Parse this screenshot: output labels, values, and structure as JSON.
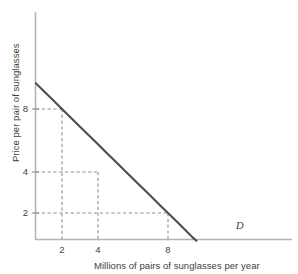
{
  "chart_data": {
    "type": "line",
    "title": "",
    "subtitle": "",
    "xlabel": "Millions of pairs of sunglasses per year",
    "ylabel": "Price per pair of sunglasses",
    "grid": false,
    "legend_position": "inline-right-end",
    "x_scale": "log",
    "y_scale": "log",
    "xlim": [
      1.35,
      12.0
    ],
    "ylim": [
      1.45,
      14.0
    ],
    "xticks": [
      2,
      4,
      8
    ],
    "xtick_labels": [
      "2",
      "4",
      "8"
    ],
    "yticks": [
      2,
      4,
      8
    ],
    "ytick_labels": [
      "2",
      "4",
      "8"
    ],
    "series": [
      {
        "name": "D",
        "label": "D",
        "description": "Demand curve, constant expenditure hyperbola p = 16 / q",
        "relation": "price = 16 / quantity",
        "x": [
          1.42,
          1.6,
          1.8,
          2.0,
          2.4,
          2.8,
          3.2,
          3.6,
          4.0,
          4.8,
          5.6,
          6.4,
          7.2,
          8.0,
          9.0,
          10.0,
          11.0,
          11.6
        ],
        "y": [
          11.27,
          10.0,
          8.89,
          8.0,
          6.67,
          5.71,
          5.0,
          4.44,
          4.0,
          3.33,
          2.86,
          2.5,
          2.22,
          2.0,
          1.78,
          1.6,
          1.45,
          1.38
        ]
      }
    ],
    "annotations": [
      {
        "name": "point-a",
        "x": 2,
        "y": 8,
        "label": "",
        "guides": "dashed",
        "marker": false
      },
      {
        "name": "point-b",
        "x": 4,
        "y": 4,
        "label": "",
        "guides": "dashed",
        "marker": false
      },
      {
        "name": "point-c",
        "x": 8,
        "y": 2,
        "label": "",
        "guides": "dashed",
        "marker": false
      }
    ]
  },
  "axes": {
    "y_title": "Price per pair of sunglasses",
    "x_title": "Millions of pairs of sunglasses per year",
    "y_ticks": [
      {
        "value": 8,
        "label": "8"
      },
      {
        "value": 4,
        "label": "4"
      },
      {
        "value": 2,
        "label": "2"
      }
    ],
    "x_ticks": [
      {
        "value": 2,
        "label": "2"
      },
      {
        "value": 4,
        "label": "4"
      },
      {
        "value": 8,
        "label": "8"
      }
    ]
  },
  "series_label": "D",
  "colors": {
    "curve": "#4d4d4d",
    "axis": "#b4b4b4",
    "guide": "#9a9a9a",
    "text": "#3d3d3d",
    "background": "#ffffff"
  }
}
